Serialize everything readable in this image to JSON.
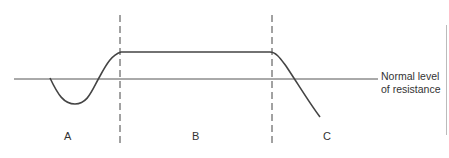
{
  "diagram": {
    "baseline_label_line1": "Normal level",
    "baseline_label_line2": "of resistance",
    "phases": [
      {
        "label": "A"
      },
      {
        "label": "B"
      },
      {
        "label": "C"
      }
    ],
    "colors": {
      "line": "#444444",
      "baseline": "#555555",
      "text": "#333333"
    }
  }
}
